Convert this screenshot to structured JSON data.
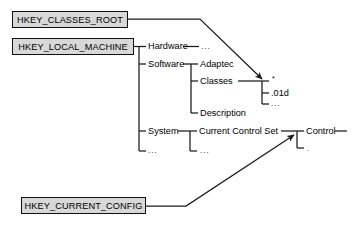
{
  "diagram": {
    "colors": {
      "box_fill": "#d8d8d8",
      "box_border": "#111111",
      "line": "#1a1a1a",
      "text": "#000000",
      "background": "#ffffff"
    },
    "root_boxes": [
      {
        "id": "hkey-classes-root",
        "label": "HKEY_CLASSES_ROOT"
      },
      {
        "id": "hkey-local-machine",
        "label": "HKEY_LOCAL_MACHINE"
      },
      {
        "id": "hkey-current-config",
        "label": "HKEY_CURRENT_CONFIG"
      }
    ],
    "tree": {
      "level1": [
        {
          "id": "hardware",
          "label": "Hardware"
        },
        {
          "id": "software",
          "label": "Software"
        },
        {
          "id": "system",
          "label": "System"
        },
        {
          "id": "hklm-ellipsis",
          "label": "..."
        }
      ],
      "hardware_children": [
        {
          "id": "hardware-ellipsis",
          "label": "..."
        }
      ],
      "software_children": [
        {
          "id": "adaptec",
          "label": "Adaptec"
        },
        {
          "id": "classes",
          "label": "Classes"
        },
        {
          "id": "description",
          "label": "Description"
        }
      ],
      "classes_children": [
        {
          "id": "classes-star",
          "label": "*"
        },
        {
          "id": "classes-01d",
          "label": ".01d"
        },
        {
          "id": "classes-ellipsis",
          "label": "..."
        }
      ],
      "system_children": [
        {
          "id": "current-control-set",
          "label": "Current Control Set"
        },
        {
          "id": "system-ellipsis",
          "label": "..."
        }
      ],
      "ccs_children": [
        {
          "id": "control",
          "label": "Control"
        },
        {
          "id": "ccs-ellipsis",
          "label": "."
        }
      ]
    },
    "arrows": [
      {
        "id": "classes-root-to-classes",
        "from": "HKEY_CLASSES_ROOT",
        "to": "Classes"
      },
      {
        "id": "current-config-to-control-set",
        "from": "HKEY_CURRENT_CONFIG",
        "to": "Current Control Set"
      }
    ]
  }
}
